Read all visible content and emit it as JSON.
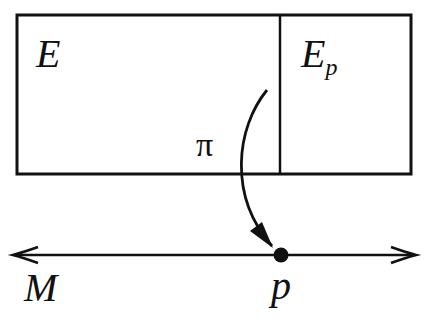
{
  "diagram": {
    "total_space": {
      "label": "E"
    },
    "fiber": {
      "label": "E",
      "subscript": "p"
    },
    "projection": {
      "label": "π"
    },
    "base_space": {
      "label": "M"
    },
    "point": {
      "label": "p"
    },
    "colors": {
      "stroke": "#111111",
      "background": "#ffffff"
    }
  }
}
